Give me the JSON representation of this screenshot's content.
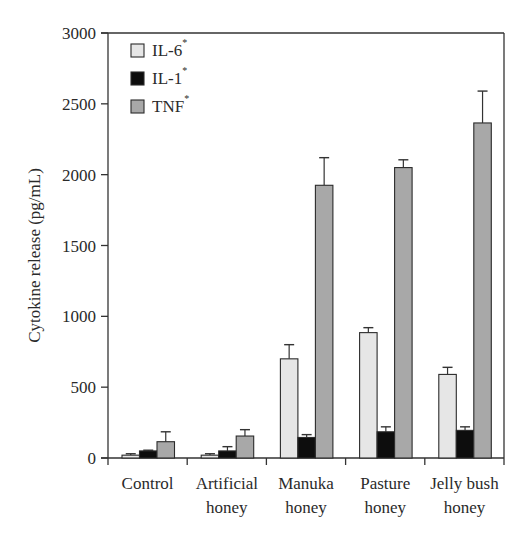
{
  "chart_data": {
    "type": "bar",
    "title": "",
    "xlabel": "",
    "ylabel": "Cytokine release (pg/mL)",
    "ylim": [
      0,
      3000
    ],
    "yticks": [
      0,
      500,
      1000,
      1500,
      2000,
      2500,
      3000
    ],
    "grid": false,
    "legend_position": "upper-left",
    "categories": [
      [
        "Control"
      ],
      [
        "Artificial",
        "honey"
      ],
      [
        "Manuka",
        "honey"
      ],
      [
        "Pasture",
        "honey"
      ],
      [
        "Jelly bush",
        "honey"
      ]
    ],
    "series": [
      {
        "name": "IL-6",
        "marker": "*",
        "color": "#e6e6e6",
        "values": [
          20,
          20,
          700,
          885,
          590
        ],
        "errors": [
          10,
          10,
          100,
          35,
          50
        ]
      },
      {
        "name": "IL-1",
        "marker": "*",
        "color": "#0d0d0d",
        "values": [
          50,
          50,
          145,
          185,
          195
        ],
        "errors": [
          5,
          30,
          20,
          35,
          25
        ]
      },
      {
        "name": "TNF",
        "marker": "*",
        "color": "#a8a8a8",
        "values": [
          115,
          155,
          1925,
          2050,
          2365
        ],
        "errors": [
          70,
          45,
          195,
          55,
          225
        ]
      }
    ]
  }
}
